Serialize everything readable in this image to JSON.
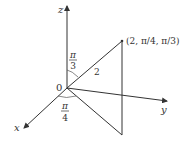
{
  "diagram": {
    "type": "spherical-coordinates",
    "axes": {
      "x_label": "x",
      "y_label": "y",
      "z_label": "z"
    },
    "origin_label": "0",
    "point_label": "(2, π/4, π/3)",
    "radius_label": "2",
    "phi_angle": {
      "numerator": "π",
      "denominator": "3"
    },
    "theta_angle": {
      "numerator": "π",
      "denominator": "4"
    },
    "colors": {
      "line": "#333333",
      "background": "#ffffff"
    }
  }
}
